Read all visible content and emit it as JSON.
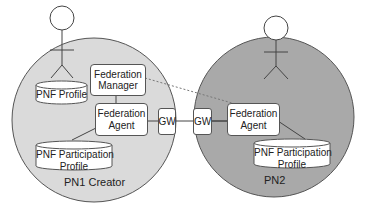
{
  "diagram": {
    "colors": {
      "pn1_fill": "#dadada",
      "pn2_fill": "#a9a9a9",
      "stroke": "#555555",
      "box_fill": "#ffffff"
    },
    "zones": [
      {
        "id": "pn1",
        "label": "PN1 Creator"
      },
      {
        "id": "pn2",
        "label": "PN2"
      }
    ],
    "actors": [
      {
        "id": "user-pn1",
        "icon": "person-icon"
      },
      {
        "id": "user-pn2",
        "icon": "person-icon"
      }
    ],
    "nodes": {
      "federation_manager": {
        "line1": "Federation",
        "line2": "Manager"
      },
      "federation_agent_pn1": {
        "line1": "Federation",
        "line2": "Agent"
      },
      "federation_agent_pn2": {
        "line1": "Federation",
        "line2": "Agent"
      },
      "gw_pn1": {
        "label": "GW"
      },
      "gw_pn2": {
        "label": "GW"
      }
    },
    "stores": {
      "pnf_profile": {
        "line1": "PNF Profile"
      },
      "pnf_participation_profile_pn1": {
        "line1": "PNF Participation",
        "line2": "Profile"
      },
      "pnf_participation_profile_pn2": {
        "line1": "PNF Participation",
        "line2": "Profile"
      }
    },
    "edges": [
      {
        "from": "federation_manager",
        "to": "federation_agent_pn1",
        "style": "solid"
      },
      {
        "from": "federation_agent_pn1",
        "to": "gw_pn1",
        "style": "solid"
      },
      {
        "from": "gw_pn1",
        "to": "gw_pn2",
        "style": "solid"
      },
      {
        "from": "gw_pn2",
        "to": "federation_agent_pn2",
        "style": "solid"
      },
      {
        "from": "federation_agent_pn1",
        "to": "pnf_participation_profile_pn1",
        "style": "solid"
      },
      {
        "from": "federation_agent_pn2",
        "to": "pnf_participation_profile_pn2",
        "style": "solid"
      },
      {
        "from": "federation_manager",
        "to": "federation_agent_pn2",
        "style": "dashed"
      }
    ]
  }
}
